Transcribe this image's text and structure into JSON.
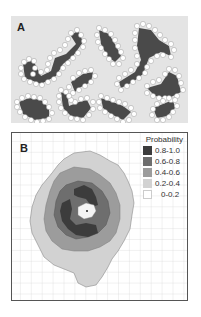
{
  "panel_a": {
    "label": "A",
    "description": "Hexagonal-lattice clusters of dark occupied cells bordered by white perimeter sites"
  },
  "panel_b": {
    "label": "B",
    "legend": {
      "title": "Probability",
      "items": [
        {
          "label": "0.8-1.0",
          "color": "#3c3c3c"
        },
        {
          "label": "0.6-0.8",
          "color": "#6e6e6e"
        },
        {
          "label": "0.4-0.6",
          "color": "#9c9c9c"
        },
        {
          "label": "0.2-0.4",
          "color": "#d2d2d2"
        },
        {
          "label": "0-0.2",
          "color": "#ffffff"
        }
      ]
    }
  },
  "colors": {
    "panel_a_bg": "#e4e4e4",
    "cluster_fill": "#4a4a4a",
    "perimeter": "#ffffff",
    "grid": "#c8c8c8",
    "border": "#555555"
  }
}
